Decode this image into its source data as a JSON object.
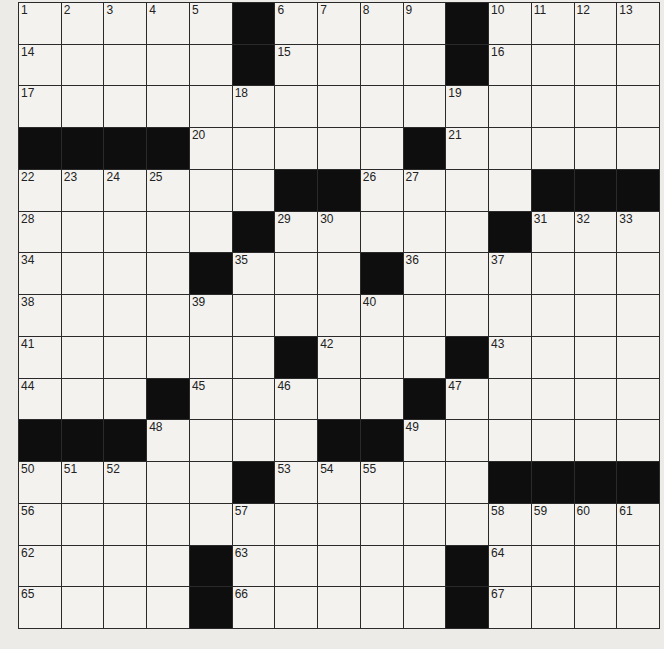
{
  "puzzle": {
    "rows": 15,
    "cols": 15,
    "layout": [
      "1,2,3,4,5,#,6,7,8,9,#,10,11,12,13",
      "14,.,.,.,.,#,15,.,.,.,#,16,.,.,.",
      "17,.,.,.,.,18,.,.,.,.,19,.,.,.,.",
      "#,#,#,#,20,.,.,.,.,#,21,.,.,.,.",
      "22,23,24,25,.,.,#,#,26,27,.,.,#,#,#",
      "28,.,.,.,.,#,29,30,.,.,.,#,31,32,33",
      "34,.,.,.,#,35,.,.,#,36,.,37,.,.,.",
      "38,.,.,.,39,.,.,.,40,.,.,.,.,.,.",
      "41,.,.,.,.,.,#,42,.,.,#,43,.,.,.",
      "44,.,.,#,45,.,46,.,.,#,47,.,.,.,.",
      "#,#,#,48,.,.,.,#,#,49,.,.,.,.,.",
      "50,51,52,.,.,#,53,54,55,.,.,#,#,#,#",
      "56,.,.,.,.,57,.,.,.,.,.,58,59,60,61",
      "62,.,.,.,#,63,.,.,.,.,#,64,.,.,.",
      "65,.,.,.,#,66,.,.,.,.,#,67,.,.,."
    ]
  }
}
